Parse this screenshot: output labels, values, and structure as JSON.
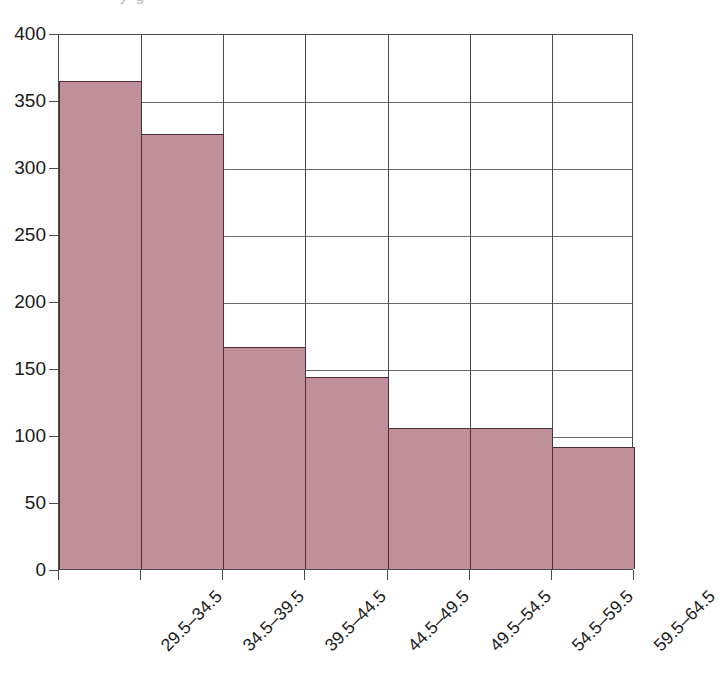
{
  "figure": {
    "cropped_top_text": "y    g",
    "bar_color": "#bf9099",
    "bar_outline_color": "#4a3034",
    "gridline_color": "#6b6b6b",
    "axis_color": "#4c4c4c"
  },
  "chart_data": {
    "type": "bar",
    "title": "",
    "subtitle": "",
    "xlabel": "",
    "ylabel": "",
    "categories": [
      "29.5–34.5",
      "34.5–39.5",
      "39.5–44.5",
      "44.5–49.5",
      "49.5–54.5",
      "54.5–59.5",
      "59.5–64.5"
    ],
    "values": [
      364,
      325,
      166,
      143,
      105,
      105,
      91
    ],
    "ylim": [
      0,
      400
    ],
    "ytick_labels": [
      "0",
      "50",
      "100",
      "150",
      "200",
      "250",
      "300",
      "350",
      "400"
    ],
    "ytick_values": [
      0,
      50,
      100,
      150,
      200,
      250,
      300,
      350,
      400
    ],
    "ytick_step": 50,
    "grid": "horizontal-and-vertical",
    "legend": "none",
    "xtick_label_rotation": -45,
    "annotations": []
  }
}
